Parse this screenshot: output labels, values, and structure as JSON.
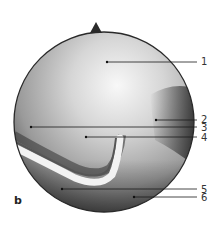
{
  "figure": {
    "panel_letter": "b",
    "view": {
      "shape": "circle",
      "center": [
        104,
        122
      ],
      "radius": 90,
      "notch_marker": "top triangular notch"
    },
    "colors": {
      "border": "#2a2a2a",
      "highlight": "#f4f4f4",
      "midtone": "#a8a8a8",
      "shadow": "#2e2e2e",
      "leader": "#1a1a1a",
      "instrument": "#e8e8e8"
    },
    "labels": [
      {
        "num": "1",
        "target": [
          107,
          62
        ],
        "label_y": 62
      },
      {
        "num": "2",
        "target": [
          156,
          120
        ],
        "label_y": 120
      },
      {
        "num": "3",
        "target": [
          31,
          127
        ],
        "label_y": 128
      },
      {
        "num": "4",
        "target": [
          86,
          137
        ],
        "label_y": 138
      },
      {
        "num": "5",
        "target": [
          62,
          189
        ],
        "label_y": 190
      },
      {
        "num": "6",
        "target": [
          134,
          197
        ],
        "label_y": 198
      }
    ]
  }
}
